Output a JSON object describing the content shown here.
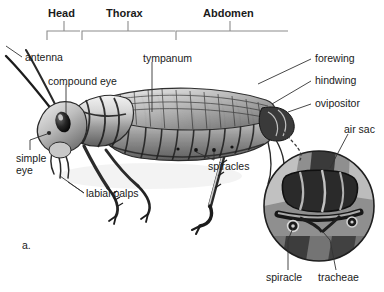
{
  "figure": {
    "panel_label": "a.",
    "background": "#ffffff",
    "line_color": "#2b2b2b",
    "bracket_color": "#8c8c8c"
  },
  "region_brackets": [
    {
      "id": "head",
      "label": "Head",
      "x1": 47,
      "x2": 80,
      "tick": 64,
      "label_x": 48,
      "label_y": 8
    },
    {
      "id": "thorax",
      "label": "Thorax",
      "x1": 82,
      "x2": 175,
      "tick": 128,
      "label_x": 109,
      "label_y": 8
    },
    {
      "id": "abdomen",
      "label": "Abdomen",
      "x1": 176,
      "x2": 288,
      "tick": 230,
      "label_x": 203,
      "label_y": 8
    }
  ],
  "callouts": [
    {
      "id": "antenna",
      "label": "antenna",
      "x": 25,
      "y": 52,
      "anchor": "left"
    },
    {
      "id": "compound-eye",
      "label": "compound eye",
      "x": 48,
      "y": 76,
      "anchor": "left"
    },
    {
      "id": "tympanum",
      "label": "tympanum",
      "x": 143,
      "y": 53,
      "anchor": "left"
    },
    {
      "id": "forewing",
      "label": "forewing",
      "x": 313,
      "y": 55,
      "anchor": "right"
    },
    {
      "id": "hindwing",
      "label": "hindwing",
      "x": 313,
      "y": 77,
      "anchor": "right"
    },
    {
      "id": "ovipositor",
      "label": "ovipositor",
      "x": 313,
      "y": 100,
      "anchor": "right"
    },
    {
      "id": "air-sac",
      "label": "air sac",
      "x": 344,
      "y": 124,
      "anchor": "right"
    },
    {
      "id": "simple-eye",
      "label": "simple\neye",
      "x": 16,
      "y": 152,
      "anchor": "left"
    },
    {
      "id": "labial-palps",
      "label": "labial palps",
      "x": 86,
      "y": 189,
      "anchor": "left"
    },
    {
      "id": "spiracles",
      "label": "spiracles",
      "x": 208,
      "y": 163,
      "anchor": "center"
    },
    {
      "id": "spiracle",
      "label": "spiracle",
      "x": 279,
      "y": 276,
      "anchor": "center"
    },
    {
      "id": "tracheae",
      "label": "tracheae",
      "x": 330,
      "y": 276,
      "anchor": "center"
    }
  ],
  "inset": {
    "id": "tracheal-system-detail",
    "center_x": 319,
    "center_y": 206,
    "radius": 56,
    "connector": "dotted"
  }
}
